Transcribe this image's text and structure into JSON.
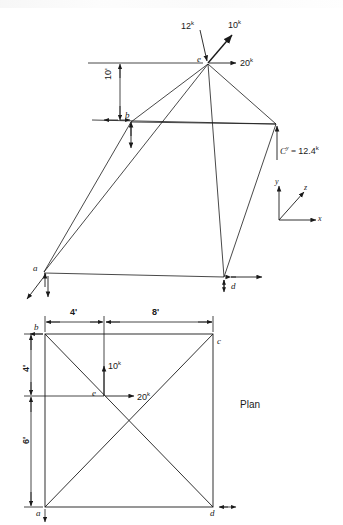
{
  "figure": {
    "title_plan": "Plan",
    "elevation": {
      "nodes": [
        {
          "id": "a",
          "label": "a",
          "x": 42,
          "y": 272
        },
        {
          "id": "b",
          "label": "b",
          "x": 131,
          "y": 120
        },
        {
          "id": "c",
          "label": "",
          "x": 276,
          "y": 126
        },
        {
          "id": "d",
          "label": "d",
          "x": 224,
          "y": 277
        },
        {
          "id": "e",
          "label": "e",
          "x": 208,
          "y": 63
        }
      ],
      "loads": [
        {
          "name": "vertical-load-12k",
          "label": "12",
          "unit": "k",
          "value": 12,
          "direction": "down",
          "label_x": 188,
          "label_y": 25
        },
        {
          "name": "diagonal-load-10k",
          "label": "10",
          "unit": "k",
          "value": 10,
          "direction": "up-right",
          "label_x": 228,
          "label_y": 24
        },
        {
          "name": "horizontal-load-20k",
          "label": "20",
          "unit": "k",
          "value": 20,
          "direction": "right",
          "label_x": 240,
          "label_y": 57
        }
      ],
      "reaction": {
        "name": "reaction-cy",
        "symbol": "C",
        "subscript": "y",
        "equals": "=",
        "value": "12.4",
        "unit": "k",
        "label_x": 281,
        "label_y": 145
      },
      "dimensions": [
        {
          "name": "height-10ft",
          "label": "10'",
          "value": "10'",
          "label_x": 106,
          "label_y": 88
        }
      ],
      "axes": {
        "name": "coordinate-triad",
        "x_label": "x",
        "y_label": "y",
        "z_label": "z",
        "origin_x": 279,
        "origin_y": 220
      }
    },
    "plan": {
      "nodes": [
        {
          "id": "b",
          "label": "b",
          "x": 39,
          "y": 326
        },
        {
          "id": "c",
          "label": "c",
          "x": 218,
          "y": 338
        },
        {
          "id": "a",
          "label": "a",
          "x": 39,
          "y": 510
        },
        {
          "id": "d",
          "label": "d",
          "x": 214,
          "y": 508
        },
        {
          "id": "e",
          "label": "e",
          "x": 98,
          "y": 396
        }
      ],
      "loads": [
        {
          "name": "plan-load-10k",
          "label": "10",
          "unit": "k",
          "value": 10,
          "direction": "up",
          "label_x": 105,
          "label_y": 360
        },
        {
          "name": "plan-load-20k",
          "label": "20",
          "unit": "k",
          "value": 20,
          "direction": "right",
          "label_x": 137,
          "label_y": 393
        }
      ],
      "dimensions": [
        {
          "name": "dim-4ft-horizontal",
          "label": "4'",
          "value": "4'",
          "label_x": 72,
          "label_y": 312
        },
        {
          "name": "dim-8ft-horizontal",
          "label": "8'",
          "value": "8'",
          "label_x": 152,
          "label_y": 312
        },
        {
          "name": "dim-4ft-vertical",
          "label": "4'",
          "value": "4'",
          "label_x": 16,
          "label_y": 363
        },
        {
          "name": "dim-6ft-vertical",
          "label": "6'",
          "value": "6'",
          "label_x": 16,
          "label_y": 435
        }
      ]
    }
  },
  "colors": {
    "line": "#1a1a1a",
    "background": "#ffffff"
  }
}
